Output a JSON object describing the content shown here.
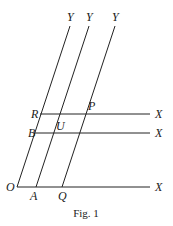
{
  "figure": {
    "caption": "Fig. 1",
    "labels": {
      "y1": "Y",
      "y2": "Y",
      "y3": "Y",
      "x1": "X",
      "x2": "X",
      "x3": "X",
      "O": "O",
      "A": "A",
      "Q": "Q",
      "R": "R",
      "B": "B",
      "U": "U",
      "P": "P"
    },
    "lines": {
      "slanted": [
        {
          "name": "OY",
          "from": [
            17,
            187
          ],
          "to": [
            70,
            26
          ]
        },
        {
          "name": "AY",
          "from": [
            36,
            187
          ],
          "to": [
            89,
            26
          ]
        },
        {
          "name": "QY",
          "from": [
            62,
            187
          ],
          "to": [
            115,
            26
          ]
        }
      ],
      "horizontal": [
        {
          "name": "RX",
          "from": [
            40,
            114
          ],
          "to": [
            150,
            114
          ]
        },
        {
          "name": "BX",
          "from": [
            34,
            133
          ],
          "to": [
            150,
            133
          ]
        },
        {
          "name": "OX",
          "from": [
            17,
            187
          ],
          "to": [
            150,
            187
          ]
        }
      ]
    },
    "colors": {
      "line": "#222222",
      "background": "#ffffff"
    }
  }
}
